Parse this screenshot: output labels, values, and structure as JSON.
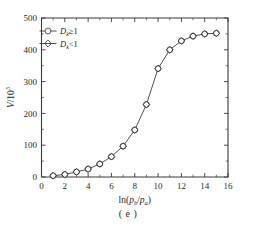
{
  "figure": {
    "caption": "( e )",
    "background_color": "#ffffff",
    "line_color": "#3c3c3c",
    "axis_color": "#3a3a3a"
  },
  "chart_data": {
    "type": "line",
    "title": "",
    "subtitle": "",
    "xlabel": "ln(p_b/p_a)",
    "xlabel_parts": {
      "prefix": "ln(",
      "numerator": "p",
      "numerator_sub": "b",
      "divider": "/",
      "denominator": "p",
      "denominator_sub": "a",
      "suffix": ")"
    },
    "ylabel": "V/10^3",
    "ylabel_parts": {
      "symbol": "V",
      "divider": "/",
      "base": "10",
      "exponent": "3"
    },
    "xlim": [
      0,
      16
    ],
    "ylim": [
      0,
      500
    ],
    "xticks": [
      0,
      2,
      4,
      6,
      8,
      10,
      12,
      14,
      16
    ],
    "yticks": [
      0,
      100,
      200,
      300,
      400,
      500
    ],
    "xtick_labels": [
      "0",
      "2",
      "4",
      "6",
      "8",
      "10",
      "12",
      "14",
      "16"
    ],
    "ytick_labels": [
      "0",
      "100",
      "200",
      "300",
      "400",
      "500"
    ],
    "x_minor_interval": 1,
    "y_minor_interval": 50,
    "grid": false,
    "legend_position": "top-left",
    "x": [
      1,
      2,
      3,
      4,
      5,
      6,
      7,
      8,
      9,
      10,
      11,
      12,
      13,
      14,
      15
    ],
    "series": [
      {
        "name": "D_k≥1",
        "label": "D",
        "label_sub": "k",
        "label_rel": "≥1",
        "marker": "circle",
        "color": "#3a3a3a",
        "values": [
          4,
          8,
          16,
          25,
          41,
          64,
          97,
          148,
          228,
          341,
          400,
          428,
          443,
          450,
          452
        ]
      },
      {
        "name": "D_k<1",
        "label": "D",
        "label_sub": "k",
        "label_rel": "<1",
        "marker": "diamond",
        "color": "#3a3a3a",
        "values": [
          4,
          8,
          16,
          25,
          41,
          64,
          97,
          148,
          228,
          341,
          400,
          428,
          443,
          450,
          452
        ]
      }
    ]
  }
}
